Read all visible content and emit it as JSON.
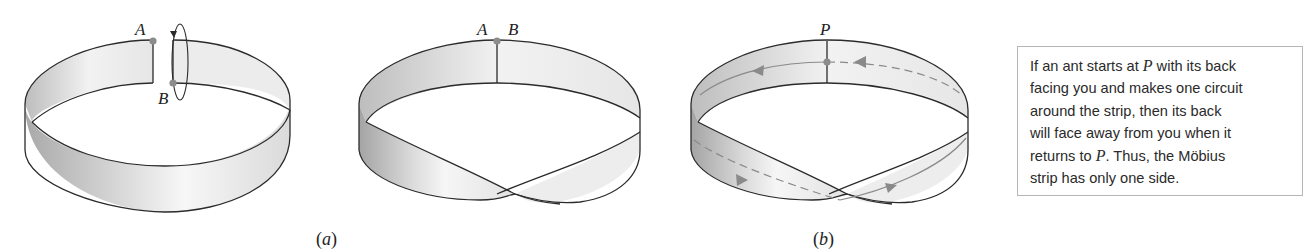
{
  "figure": {
    "panel_a": {
      "caption": "a",
      "strip1": {
        "label_top": "A",
        "label_bottom": "B",
        "description": "untwisted band cut open, with rotation arrow around end B"
      },
      "strip2": {
        "label_left": "A",
        "label_right": "B",
        "description": "band joined after half-twist, A meets B"
      }
    },
    "panel_b": {
      "caption": "b",
      "strip": {
        "label": "P",
        "description": "Möbius strip with a dashed/solid circuit path and direction arrows through point P"
      }
    },
    "note": {
      "lines": [
        [
          "If an ant starts at ",
          "P",
          " with its back"
        ],
        [
          "facing you and makes one circuit"
        ],
        [
          "around the strip, then its back"
        ],
        [
          "will face away from you when it"
        ],
        [
          "returns to ",
          "P",
          ".  Thus, the Möbius"
        ],
        [
          "strip has only one side."
        ]
      ]
    },
    "colors": {
      "stroke": "#2b2b2b",
      "point": "#8c8c8c",
      "path": "#8a8a8a",
      "shade_dark": "#a8a8a8",
      "shade_light": "#f4f4f4",
      "box_border": "#b5b5b5"
    }
  }
}
